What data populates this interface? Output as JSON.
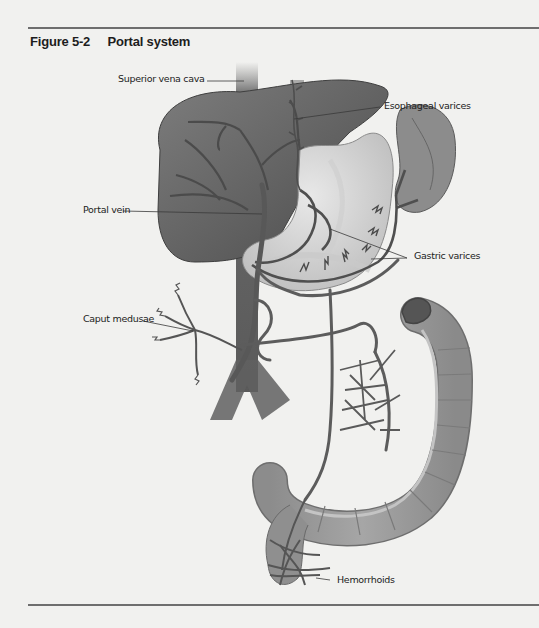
{
  "figure": {
    "number": "Figure 5-2",
    "title": "Portal system"
  },
  "labels": {
    "superior_vena_cava": "Superior vena cava",
    "esophageal_varices": "Esophageal varices",
    "portal_vein": "Portal vein",
    "gastric_varices": "Gastric varices",
    "caput_medusae": "Caput medusae",
    "hemorrhoids": "Hemorrhoids"
  },
  "colors": {
    "background": "#f1f1ef",
    "rule": "#6e6e6e",
    "liver": "#6f6f6f",
    "vessel": "#5a5a5a",
    "stomach": "#d7d7d7",
    "spleen": "#8a8a8a",
    "colon": "#9a9a9a"
  }
}
